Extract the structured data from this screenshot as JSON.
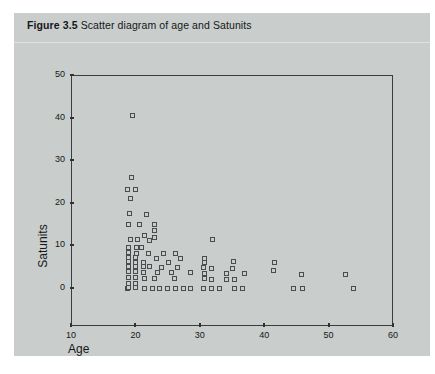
{
  "figure": {
    "label": "Figure 3.5",
    "caption": "Scatter diagram of age and Satunits"
  },
  "colors": {
    "panel": "#c9cdcb",
    "page": "#ffffff",
    "axis": "#3a3d3f",
    "marker_edge": "#4a4d4f",
    "rule": "#dfe2e0",
    "text": "#15171a"
  },
  "chart_data": {
    "type": "scatter",
    "title": "Scatter diagram of age and Satunits",
    "xlabel": "Age",
    "ylabel": "Satunits",
    "xlim": [
      10,
      60
    ],
    "ylim": [
      0,
      50
    ],
    "xticks": [
      10,
      20,
      30,
      40,
      50,
      60
    ],
    "yticks": [
      0,
      10,
      20,
      30,
      40,
      50
    ],
    "grid": false,
    "legend": null,
    "marker": "open-square",
    "points": [
      [
        19.6,
        40.5
      ],
      [
        19.4,
        26.0
      ],
      [
        18.8,
        23.2
      ],
      [
        20.0,
        23.2
      ],
      [
        19.2,
        21.0
      ],
      [
        19.1,
        17.6
      ],
      [
        21.8,
        17.2
      ],
      [
        19.0,
        15.0
      ],
      [
        20.6,
        15.0
      ],
      [
        23.0,
        14.8
      ],
      [
        23.0,
        13.4
      ],
      [
        21.4,
        12.4
      ],
      [
        23.0,
        11.8
      ],
      [
        19.2,
        11.4
      ],
      [
        20.4,
        11.4
      ],
      [
        22.2,
        11.2
      ],
      [
        32.0,
        11.4
      ],
      [
        19.0,
        9.6
      ],
      [
        20.2,
        9.4
      ],
      [
        21.0,
        9.4
      ],
      [
        19.0,
        8.4
      ],
      [
        20.2,
        8.2
      ],
      [
        22.0,
        8.2
      ],
      [
        24.4,
        8.2
      ],
      [
        26.2,
        8.2
      ],
      [
        19.0,
        7.2
      ],
      [
        20.0,
        7.2
      ],
      [
        23.2,
        7.0
      ],
      [
        27.0,
        7.0
      ],
      [
        30.8,
        7.0
      ],
      [
        19.0,
        6.2
      ],
      [
        20.0,
        6.0
      ],
      [
        21.2,
        6.0
      ],
      [
        25.2,
        6.0
      ],
      [
        30.8,
        6.0
      ],
      [
        35.2,
        6.2
      ],
      [
        41.6,
        6.0
      ],
      [
        19.0,
        5.0
      ],
      [
        20.0,
        5.0
      ],
      [
        21.2,
        5.0
      ],
      [
        22.2,
        5.0
      ],
      [
        24.0,
        4.8
      ],
      [
        26.6,
        4.8
      ],
      [
        30.6,
        4.8
      ],
      [
        31.8,
        4.6
      ],
      [
        35.0,
        4.6
      ],
      [
        41.4,
        4.2
      ],
      [
        19.0,
        3.8
      ],
      [
        20.0,
        3.8
      ],
      [
        21.2,
        3.6
      ],
      [
        23.4,
        3.6
      ],
      [
        25.6,
        3.6
      ],
      [
        28.6,
        3.6
      ],
      [
        30.8,
        3.4
      ],
      [
        34.2,
        3.4
      ],
      [
        37.0,
        3.4
      ],
      [
        45.8,
        3.2
      ],
      [
        52.6,
        3.2
      ],
      [
        19.0,
        2.4
      ],
      [
        20.0,
        2.4
      ],
      [
        21.4,
        2.2
      ],
      [
        23.0,
        2.2
      ],
      [
        26.0,
        2.2
      ],
      [
        30.8,
        2.2
      ],
      [
        31.8,
        2.0
      ],
      [
        34.2,
        2.0
      ],
      [
        35.4,
        2.0
      ],
      [
        19.0,
        1.0
      ],
      [
        20.0,
        1.0
      ],
      [
        18.8,
        0.0
      ],
      [
        19.0,
        0.2
      ],
      [
        20.0,
        0.2
      ],
      [
        21.4,
        0.0
      ],
      [
        22.6,
        0.0
      ],
      [
        23.8,
        0.0
      ],
      [
        25.0,
        0.0
      ],
      [
        26.2,
        0.0
      ],
      [
        27.4,
        0.0
      ],
      [
        28.6,
        0.0
      ],
      [
        30.6,
        0.0
      ],
      [
        31.8,
        0.0
      ],
      [
        33.0,
        0.0
      ],
      [
        35.4,
        0.0
      ],
      [
        36.6,
        0.0
      ],
      [
        44.6,
        0.0
      ],
      [
        46.0,
        0.0
      ],
      [
        53.8,
        0.0
      ]
    ]
  }
}
